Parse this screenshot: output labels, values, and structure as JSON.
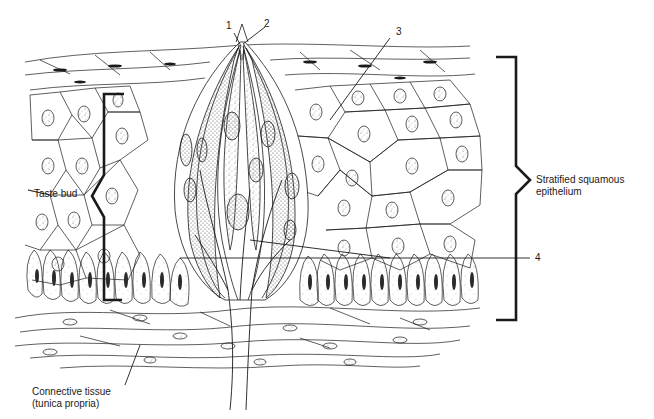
{
  "figure": {
    "labels": {
      "taste_bud": "Taste bud",
      "epithelium_line1": "Stratified squamous",
      "epithelium_line2": "epithelium",
      "connective_line1": "Connective tissue",
      "connective_line2": "(tunica propria)"
    },
    "callouts": [
      "1",
      "2",
      "3",
      "4"
    ],
    "colors": {
      "ink": "#1a1a1a",
      "background": "#ffffff",
      "stipple": "#555555"
    }
  }
}
